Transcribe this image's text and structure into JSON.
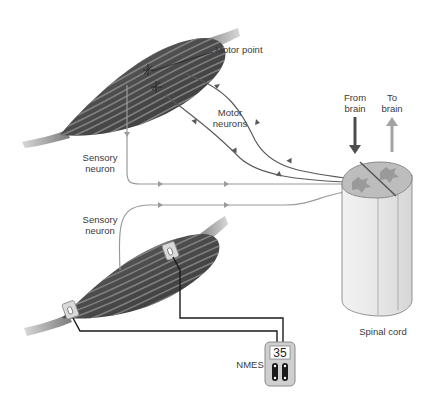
{
  "diagram": {
    "labels": {
      "motor_point": "Motor point",
      "motor_neurons": "Motor\nneurons",
      "sensory_neuron_top": "Sensory\nneuron",
      "sensory_neuron_bottom": "Sensory\nneuron",
      "from_brain": "From\nbrain",
      "to_brain": "To\nbrain",
      "spinal_cord": "Spinal cord",
      "nmes": "NMES"
    },
    "nmes_device": {
      "display_value": "35",
      "channels": 2
    },
    "components": [
      {
        "name": "upper-muscle",
        "type": "muscle",
        "features": [
          "motor-point-markers"
        ]
      },
      {
        "name": "lower-muscle",
        "type": "muscle",
        "features": [
          "electrode-pads"
        ]
      },
      {
        "name": "spinal-cord",
        "type": "spinal-cord-segment"
      },
      {
        "name": "nmes-unit",
        "type": "stimulator"
      }
    ],
    "pathways": [
      {
        "name": "motor-neuron-1",
        "from": "spinal-cord",
        "to": "upper-muscle",
        "direction": "efferent"
      },
      {
        "name": "motor-neuron-2",
        "from": "spinal-cord",
        "to": "upper-muscle",
        "direction": "efferent"
      },
      {
        "name": "sensory-neuron-top",
        "from": "upper-muscle",
        "to": "spinal-cord",
        "direction": "afferent"
      },
      {
        "name": "sensory-neuron-bottom",
        "from": "lower-muscle",
        "to": "spinal-cord",
        "direction": "afferent"
      },
      {
        "name": "from-brain-arrow",
        "direction": "descending"
      },
      {
        "name": "to-brain-arrow",
        "direction": "ascending"
      }
    ],
    "colors": {
      "muscle_dark": "#4a4a4a",
      "muscle_stripe": "#7a7a7a",
      "tendon": "#b8b8b8",
      "motor_neuron": "#5a5a5a",
      "sensory_neuron": "#9a9a9a",
      "from_brain_arrow": "#4d4d4d",
      "to_brain_arrow": "#a3a3a3",
      "spinal_cord_body": "#e6e6e6",
      "spinal_cord_top": "#bdbdbd",
      "electrode_wire": "#1a1a1a"
    }
  }
}
